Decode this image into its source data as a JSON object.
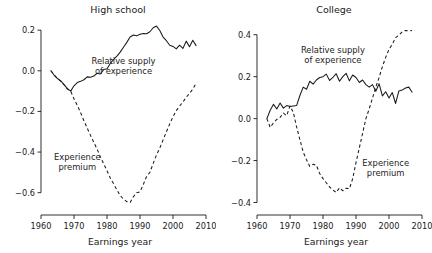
{
  "figure": {
    "panels": [
      "High school",
      "College"
    ]
  },
  "chart_data": [
    {
      "type": "line",
      "title": "High school",
      "xlabel": "Earnings year",
      "ylabel": "",
      "xlim": [
        1960,
        2010
      ],
      "ylim": [
        -0.7,
        0.25
      ],
      "xticks": [
        1960,
        1970,
        1980,
        1990,
        2000,
        2010
      ],
      "xticklabels": [
        "1960",
        "1970",
        "1980",
        "1990",
        "2000",
        "2010"
      ],
      "yticks": [
        0.2,
        0.0,
        -0.2,
        -0.4,
        -0.6
      ],
      "yticklabels": [
        "0.2",
        "0.0",
        "-0.2",
        "-0.4",
        "-0.6"
      ],
      "grid": false,
      "legend": "inline annotations",
      "annotations": [
        {
          "text": "Relative supply of experience",
          "lines": [
            "Relative supply",
            "of experience"
          ],
          "x": 1985,
          "y": 0.035,
          "style": "solid"
        },
        {
          "text": "Experience premium",
          "lines": [
            "Experience",
            "premium"
          ],
          "x": 1971,
          "y": -0.44,
          "style": "dashed"
        }
      ],
      "series": [
        {
          "name": "Relative supply of experience",
          "style": "solid",
          "x": [
            1963,
            1964,
            1965,
            1966,
            1967,
            1968,
            1969,
            1970,
            1971,
            1972,
            1973,
            1974,
            1975,
            1976,
            1977,
            1978,
            1979,
            1980,
            1981,
            1982,
            1983,
            1984,
            1985,
            1986,
            1987,
            1988,
            1989,
            1990,
            1991,
            1992,
            1993,
            1994,
            1995,
            1996,
            1997,
            1998,
            1999,
            2000,
            2001,
            2002,
            2003,
            2004,
            2005,
            2006,
            2007
          ],
          "y": [
            0.0,
            -0.022,
            -0.038,
            -0.05,
            -0.068,
            -0.088,
            -0.1,
            -0.074,
            -0.058,
            -0.052,
            -0.044,
            -0.03,
            -0.032,
            -0.026,
            -0.012,
            -0.016,
            0.006,
            0.01,
            0.036,
            0.056,
            0.072,
            0.092,
            0.116,
            0.14,
            0.166,
            0.176,
            0.172,
            0.18,
            0.184,
            0.182,
            0.192,
            0.212,
            0.22,
            0.198,
            0.166,
            0.148,
            0.126,
            0.12,
            0.108,
            0.126,
            0.11,
            0.146,
            0.118,
            0.15,
            0.124
          ]
        },
        {
          "name": "Experience premium",
          "style": "dashed",
          "x": [
            1963,
            1964,
            1965,
            1966,
            1967,
            1968,
            1969,
            1970,
            1971,
            1972,
            1973,
            1974,
            1975,
            1976,
            1977,
            1978,
            1979,
            1980,
            1981,
            1982,
            1983,
            1984,
            1985,
            1986,
            1987,
            1988,
            1989,
            1990,
            1991,
            1992,
            1993,
            1994,
            1995,
            1996,
            1997,
            1998,
            1999,
            2000,
            2001,
            2002,
            2003,
            2004,
            2005,
            2006,
            2007
          ],
          "y": [
            0.0,
            -0.02,
            -0.038,
            -0.052,
            -0.07,
            -0.09,
            -0.1,
            -0.138,
            -0.17,
            -0.206,
            -0.246,
            -0.282,
            -0.318,
            -0.352,
            -0.386,
            -0.424,
            -0.458,
            -0.492,
            -0.528,
            -0.556,
            -0.586,
            -0.614,
            -0.632,
            -0.644,
            -0.648,
            -0.62,
            -0.6,
            -0.596,
            -0.56,
            -0.52,
            -0.5,
            -0.456,
            -0.414,
            -0.38,
            -0.34,
            -0.3,
            -0.262,
            -0.226,
            -0.196,
            -0.174,
            -0.154,
            -0.13,
            -0.112,
            -0.09,
            -0.062
          ]
        }
      ]
    },
    {
      "type": "line",
      "title": "College",
      "xlabel": "Earnings year",
      "ylabel": "",
      "xlim": [
        1960,
        2010
      ],
      "ylim": [
        -0.45,
        0.47
      ],
      "xticks": [
        1960,
        1970,
        1980,
        1990,
        2000,
        2010
      ],
      "xticklabels": [
        "1960",
        "1970",
        "1980",
        "1990",
        "2000",
        "2010"
      ],
      "yticks": [
        0.4,
        0.2,
        0.0,
        -0.2,
        -0.4
      ],
      "yticklabels": [
        "0.4",
        "0.2",
        "0.0",
        "-0.2",
        "-0.4"
      ],
      "grid": false,
      "legend": "inline annotations",
      "annotations": [
        {
          "text": "Relative supply of experience",
          "lines": [
            "Relative supply",
            "of experience"
          ],
          "x": 1983,
          "y": 0.315,
          "style": "solid"
        },
        {
          "text": "Experience premium",
          "lines": [
            "Experience",
            "premium"
          ],
          "x": 1999,
          "y": -0.225,
          "style": "dashed"
        }
      ],
      "series": [
        {
          "name": "Relative supply of experience",
          "style": "solid",
          "x": [
            1963,
            1964,
            1965,
            1966,
            1967,
            1968,
            1969,
            1970,
            1971,
            1972,
            1973,
            1974,
            1975,
            1976,
            1977,
            1978,
            1979,
            1980,
            1981,
            1982,
            1983,
            1984,
            1985,
            1986,
            1987,
            1988,
            1989,
            1990,
            1991,
            1992,
            1993,
            1994,
            1995,
            1996,
            1997,
            1998,
            1999,
            2000,
            2001,
            2002,
            2003,
            2004,
            2005,
            2006,
            2007
          ],
          "y": [
            0.0,
            0.04,
            0.068,
            0.046,
            0.074,
            0.05,
            0.062,
            0.058,
            0.06,
            0.062,
            0.11,
            0.15,
            0.14,
            0.178,
            0.164,
            0.184,
            0.196,
            0.2,
            0.212,
            0.182,
            0.196,
            0.214,
            0.178,
            0.2,
            0.216,
            0.18,
            0.208,
            0.196,
            0.172,
            0.184,
            0.162,
            0.15,
            0.162,
            0.13,
            0.166,
            0.108,
            0.128,
            0.098,
            0.124,
            0.072,
            0.132,
            0.136,
            0.146,
            0.15,
            0.126
          ]
        },
        {
          "name": "Experience premium",
          "style": "dashed",
          "x": [
            1963,
            1964,
            1965,
            1966,
            1967,
            1968,
            1969,
            1970,
            1971,
            1972,
            1973,
            1974,
            1975,
            1976,
            1977,
            1978,
            1979,
            1980,
            1981,
            1982,
            1983,
            1984,
            1985,
            1986,
            1987,
            1988,
            1989,
            1990,
            1991,
            1992,
            1993,
            1994,
            1995,
            1996,
            1997,
            1998,
            1999,
            2000,
            2001,
            2002,
            2003,
            2004,
            2005,
            2006,
            2007
          ],
          "y": [
            0.0,
            -0.042,
            -0.02,
            -0.004,
            0.006,
            0.026,
            0.014,
            0.06,
            0.03,
            -0.04,
            -0.1,
            -0.16,
            -0.196,
            -0.228,
            -0.218,
            -0.222,
            -0.262,
            -0.286,
            -0.306,
            -0.326,
            -0.34,
            -0.352,
            -0.33,
            -0.344,
            -0.332,
            -0.334,
            -0.286,
            -0.21,
            -0.14,
            -0.07,
            0.0,
            0.046,
            0.098,
            0.15,
            0.196,
            0.248,
            0.292,
            0.33,
            0.354,
            0.386,
            0.398,
            0.414,
            0.42,
            0.418,
            0.42
          ]
        }
      ]
    }
  ]
}
